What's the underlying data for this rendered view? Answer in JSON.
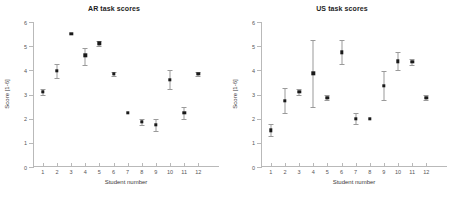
{
  "figure": {
    "width": 457,
    "height": 201,
    "background": "#ffffff",
    "marker_color": "#1a1a1a",
    "errorbar_color": "#9a9a9a",
    "axis_color": "#b9b9b9"
  },
  "chart_data": [
    {
      "type": "scatter",
      "title": "AR task scores",
      "xlabel": "Student number",
      "ylabel": "Score [1-6]",
      "xlim": [
        0.3,
        12.9
      ],
      "ylim": [
        0,
        6
      ],
      "xticks": [
        1,
        2,
        3,
        4,
        5,
        6,
        7,
        8,
        9,
        10,
        11,
        12
      ],
      "xticklabels": [
        "1",
        "2",
        "3",
        "4",
        "5",
        "6",
        "7",
        "8",
        "9",
        "10",
        "11",
        "12"
      ],
      "yticks": [
        0,
        1,
        2,
        3,
        4,
        5,
        6
      ],
      "yticklabels": [
        "0",
        "1",
        "2",
        "3",
        "4",
        "5",
        "6"
      ],
      "grid": false,
      "legend": "none",
      "x": [
        1,
        2,
        3,
        4,
        5,
        6,
        7,
        8,
        9,
        10,
        11,
        12
      ],
      "values": [
        3.1,
        3.98,
        5.5,
        4.62,
        5.12,
        3.85,
        2.25,
        1.87,
        1.75,
        3.62,
        2.25,
        3.85
      ],
      "yerr_low": [
        0.13,
        0.28,
        0.0,
        0.38,
        0.1,
        0.1,
        0.0,
        0.13,
        0.25,
        0.4,
        0.25,
        0.08
      ],
      "yerr_high": [
        0.13,
        0.28,
        0.0,
        0.3,
        0.1,
        0.1,
        0.0,
        0.13,
        0.25,
        0.4,
        0.25,
        0.08
      ]
    },
    {
      "type": "scatter",
      "title": "US task scores",
      "xlabel": "Student number",
      "ylabel": "Score [1-6]",
      "xlim": [
        0.3,
        12.9
      ],
      "ylim": [
        0,
        6
      ],
      "xticks": [
        1,
        2,
        3,
        4,
        5,
        6,
        7,
        8,
        9,
        10,
        11,
        12
      ],
      "xticklabels": [
        "1",
        "2",
        "3",
        "4",
        "5",
        "6",
        "7",
        "8",
        "9",
        "10",
        "11",
        "12"
      ],
      "yticks": [
        0,
        1,
        2,
        3,
        4,
        5,
        6
      ],
      "yticklabels": [
        "0",
        "1",
        "2",
        "3",
        "4",
        "5",
        "6"
      ],
      "grid": false,
      "legend": "none",
      "x": [
        1,
        2,
        3,
        4,
        5,
        6,
        7,
        8,
        9,
        10,
        11,
        12
      ],
      "values": [
        1.52,
        2.75,
        3.1,
        3.87,
        2.87,
        4.75,
        2.0,
        2.0,
        3.37,
        4.37,
        4.35,
        2.87
      ],
      "yerr_low": [
        0.25,
        0.5,
        0.12,
        1.37,
        0.1,
        0.5,
        0.22,
        0.0,
        0.6,
        0.37,
        0.13,
        0.1
      ],
      "yerr_high": [
        0.25,
        0.5,
        0.12,
        1.37,
        0.1,
        0.5,
        0.22,
        0.0,
        0.6,
        0.37,
        0.13,
        0.1
      ]
    }
  ]
}
